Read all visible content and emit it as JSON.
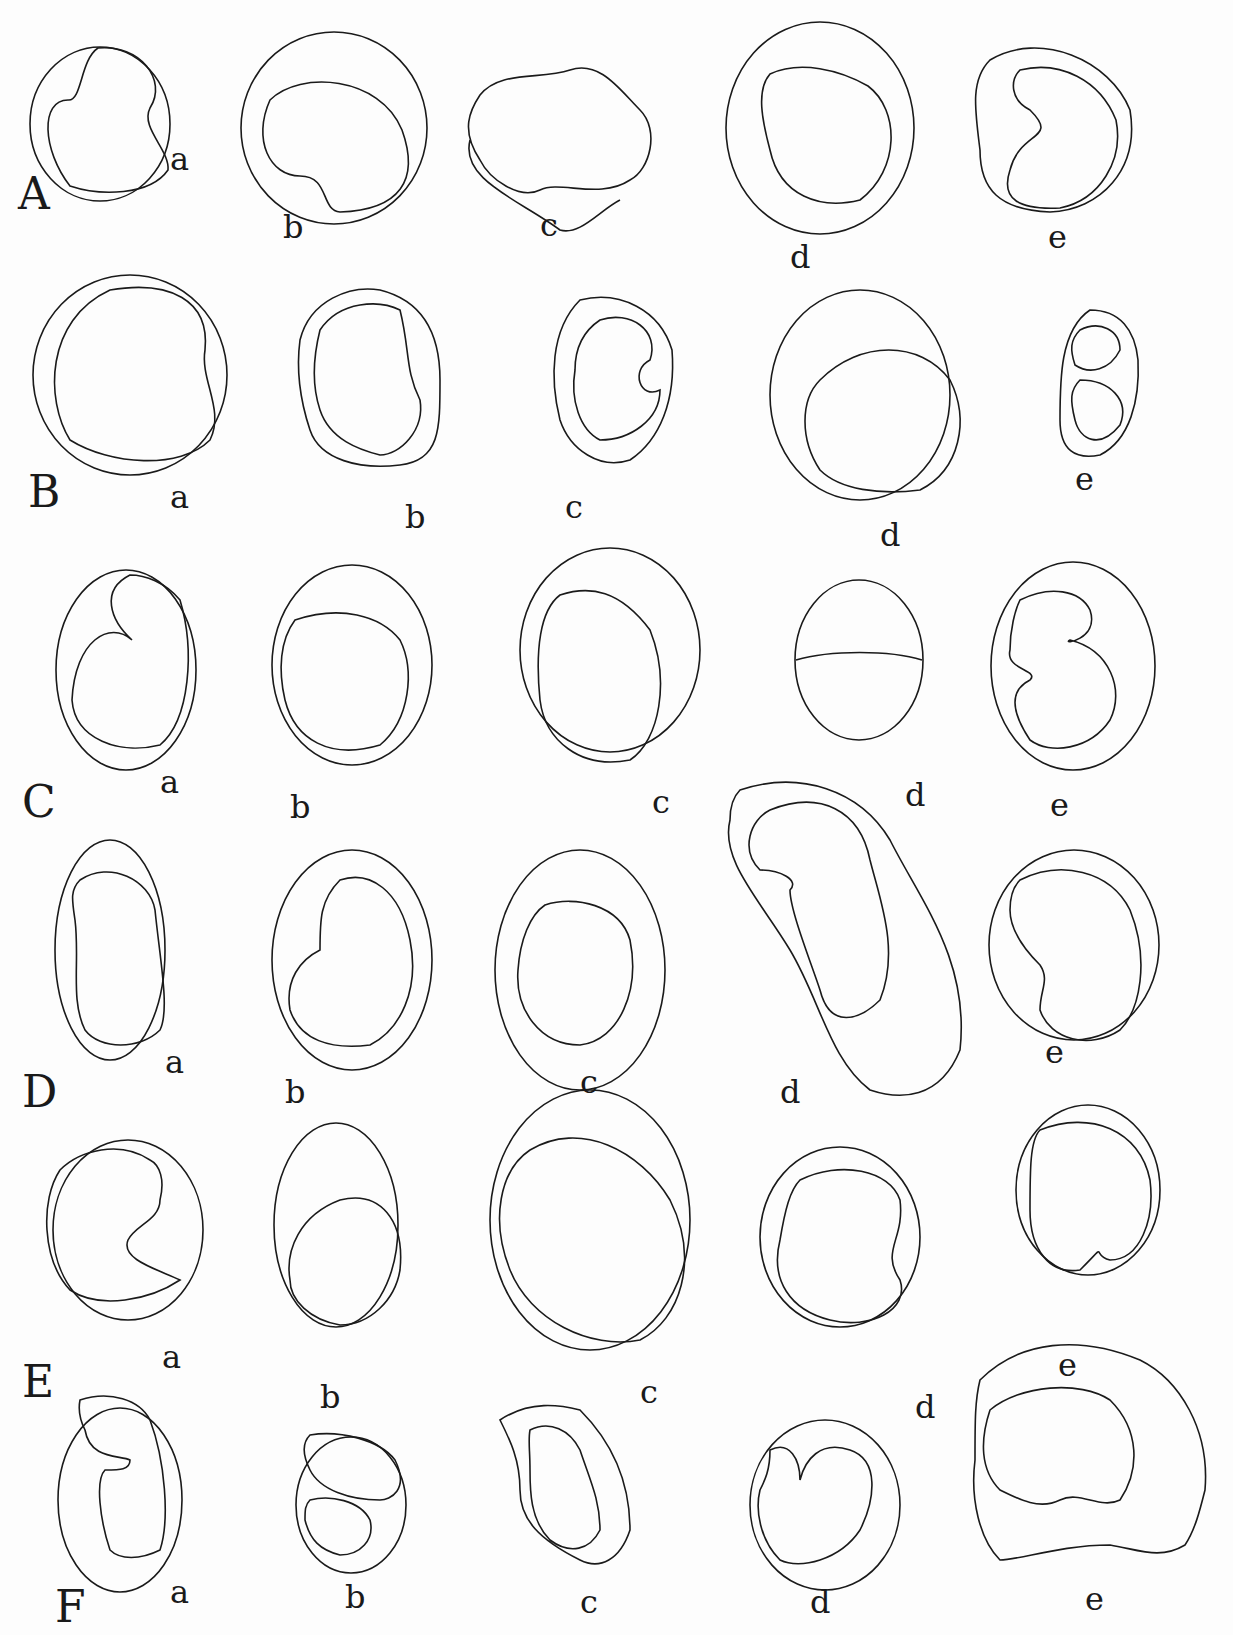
{
  "plate": {
    "rows": [
      {
        "label": "A",
        "label_pos": [
          18,
          212
        ],
        "cells": [
          {
            "label": "a",
            "label_pos": [
              170,
              172
            ],
            "outer": [
              100,
              124,
              70,
              77
            ],
            "inner": "M98,48 C140,44 168,80 150,108 C140,128 170,150 168,170 C150,196 100,196 70,186 C42,150 40,100 68,100 C82,102 80,60 98,48Z"
          },
          {
            "label": "b",
            "label_pos": [
              283,
              240
            ],
            "outer": [
              334,
              128,
              93,
              96
            ],
            "inner": "M270,100 C300,70 380,76 402,130 C420,180 400,210 340,212 C320,210 330,176 300,176 C270,176 252,140 270,100Z"
          },
          {
            "label": "c",
            "label_pos": [
              540,
              238
            ],
            "outer": null,
            "inner": "M480,95 C500,70 540,80 570,70 C600,60 620,90 640,110 C660,130 650,170 630,180 C600,200 560,180 540,190 C520,200 490,180 480,160 C460,130 470,110 480,95Z M470,140 C460,180 520,200 560,230 C580,236 600,210 620,200"
          },
          {
            "label": "d",
            "label_pos": [
              790,
              270
            ],
            "outer": [
              820,
              128,
              94,
              106
            ],
            "inner": "M770,74 C800,60 840,70 868,86 C900,110 900,170 860,200 C820,210 780,196 770,150 C762,120 756,90 770,74Z"
          },
          {
            "label": "e",
            "label_pos": [
              1048,
              250
            ],
            "outer": null,
            "inner": "M1020,70 C1060,60 1100,80 1116,120 C1124,160 1100,200 1060,208 C1020,210 1000,200 1010,170 C1020,130 1060,140 1030,110 C1010,100 1010,80 1020,70Z M990,60 C1040,30 1110,60 1130,110 C1140,170 1100,210 1050,212 C1000,210 980,190 980,150 C975,110 970,80 990,60Z"
          }
        ]
      },
      {
        "label": "B",
        "label_pos": [
          28,
          510
        ],
        "cells": [
          {
            "label": "a",
            "label_pos": [
              170,
              510
            ],
            "outer": [
              130,
              375,
              97,
              100
            ],
            "inner": "M110,290 C170,280 210,300 205,350 C200,380 225,410 210,440 C180,470 110,465 70,440 C45,400 45,320 110,290Z"
          },
          {
            "label": "b",
            "label_pos": [
              405,
              530
            ],
            "outer": null,
            "inner": "M300,340 C310,300 350,285 380,290 C420,300 440,330 440,380 C440,430 440,460 400,465 C360,470 320,460 310,430 C300,400 296,370 300,340Z M320,330 C340,300 380,300 400,310 C410,350 405,370 420,400 C425,430 400,455 380,455 C360,450 330,440 320,410 C310,380 315,350 320,330Z"
          },
          {
            "label": "c",
            "label_pos": [
              565,
              520
            ],
            "outer": null,
            "inner": "M580,300 C620,290 660,310 672,350 C676,400 660,440 630,460 C600,470 570,450 560,420 C550,380 550,330 580,300Z M600,320 C630,310 660,330 650,360 C630,370 640,400 660,390 C660,420 630,440 600,440 C580,430 570,400 575,370 C575,345 585,330 600,320Z"
          },
          {
            "label": "d",
            "label_pos": [
              880,
              548
            ],
            "outer": [
              860,
              395,
              90,
              105
            ],
            "inner": "M820,380 C860,340 920,340 950,380 C970,420 960,470 920,490 C880,495 840,490 820,470 C800,440 800,400 820,380Z"
          },
          {
            "label": "e",
            "label_pos": [
              1075,
              492
            ],
            "outer": null,
            "inner": "M1090,310 C1120,310 1135,330 1138,360 C1140,400 1130,440 1100,455 C1075,460 1060,450 1060,420 C1060,380 1060,330 1090,310Z M1080,330 C1100,320 1120,330 1120,350 C1110,370 1090,375 1075,365 C1070,350 1070,340 1080,330Z M1080,380 C1110,380 1130,400 1120,425 C1100,450 1080,440 1075,420 C1070,400 1070,390 1080,380Z"
          }
        ]
      },
      {
        "label": "C",
        "label_pos": [
          22,
          820
        ],
        "cells": [
          {
            "label": "a",
            "label_pos": [
              160,
              795
            ],
            "outer": [
              126,
              670,
              70,
              100
            ],
            "inner": "M130,575 C100,590 110,620 132,640 C110,620 75,640 72,700 C75,740 120,755 160,745 C190,720 195,650 180,600 C165,582 145,575 130,575Z"
          },
          {
            "label": "b",
            "label_pos": [
              290,
              820
            ],
            "outer": [
              352,
              665,
              80,
              100
            ],
            "inner": "M295,620 C340,605 380,615 400,640 C415,670 410,720 380,745 C330,760 295,740 285,700 C278,670 280,640 295,620Z"
          },
          {
            "label": "c",
            "label_pos": [
              652,
              815
            ],
            "outer": [
              610,
              650,
              90,
              102
            ],
            "inner": "M560,595 C590,585 620,590 650,630 C670,680 660,740 630,760 C580,770 545,740 540,700 C535,650 540,610 560,595Z"
          },
          {
            "label": "d",
            "label_pos": [
              905,
              808
            ],
            "outer": [
              859,
              660,
              64,
              80
            ],
            "inner": "M796,660 C830,650 890,650 922,660"
          },
          {
            "label": "e",
            "label_pos": [
              1050,
              818
            ],
            "outer": [
              1073,
              666,
              82,
              104
            ],
            "inner": "M1020,600 C1050,585 1080,590 1090,610 C1100,640 1060,645 1070,640 C1110,650 1125,690 1110,720 C1090,750 1050,755 1030,740 C1010,710 1010,690 1030,680 C1040,670 1005,670 1010,650 C1010,630 1015,610 1020,600Z"
          }
        ]
      },
      {
        "label": "D",
        "label_pos": [
          22,
          1110
        ],
        "cells": [
          {
            "label": "a",
            "label_pos": [
              165,
              1075
            ],
            "outer": [
              110,
              950,
              55,
              110
            ],
            "inner": "M80,880 C110,860 150,880 155,910 C160,960 170,1010 160,1030 C140,1050 100,1050 85,1030 C70,1000 80,960 75,920 C72,900 70,890 80,880Z"
          },
          {
            "label": "b",
            "label_pos": [
              285,
              1105
            ],
            "outer": [
              352,
              960,
              80,
              110
            ],
            "inner": "M340,880 C370,870 400,890 410,940 C420,990 400,1030 370,1045 C330,1050 300,1040 290,1010 C285,980 300,960 320,950 C320,920 320,900 340,880Z"
          },
          {
            "label": "c",
            "label_pos": [
              580,
              1095
            ],
            "outer": [
              580,
              970,
              85,
              120
            ],
            "inner": "M545,905 C575,895 620,905 630,940 C640,990 620,1040 580,1045 C540,1045 515,1010 518,970 C520,940 530,915 545,905Z"
          },
          {
            "label": "d",
            "label_pos": [
              780,
              1105
            ],
            "outer": null,
            "inner": "M770,810 C820,790 860,810 870,860 C880,900 900,950 880,1000 C860,1020 830,1030 820,990 C810,960 790,910 790,890 C800,880 780,870 760,870 C740,850 750,820 770,810Z M740,790 C800,770 860,790 890,840 C920,900 970,960 960,1050 C940,1100 900,1100 870,1090 C830,1060 820,1000 790,950 C760,900 720,860 730,820 C730,805 735,795 740,790Z"
          },
          {
            "label": "e",
            "label_pos": [
              1045,
              1065
            ],
            "outer": [
              1074,
              945,
              85,
              95
            ],
            "inner": "M1020,880 C1060,860 1110,870 1130,910 C1150,960 1140,1010 1120,1030 C1090,1050 1050,1040 1040,1010 C1040,990 1050,980 1040,965 C1025,950 1010,930 1010,910 C1010,895 1015,885 1020,880Z"
          }
        ]
      },
      {
        "label": "E",
        "label_pos": [
          22,
          1400
        ],
        "cells": [
          {
            "label": "a",
            "label_pos": [
              162,
              1370
            ],
            "outer": [
              128,
              1230,
              75,
              90
            ],
            "inner": "M150,1160 C120,1140 80,1150 60,1170 C40,1200 42,1260 70,1290 C100,1310 150,1300 180,1280 C160,1270 120,1260 128,1240 C135,1225 160,1220 160,1200 C165,1180 160,1165 150,1160Z"
          },
          {
            "label": "b",
            "label_pos": [
              320,
              1410
            ],
            "outer": [
              336,
              1225,
              62,
              102
            ],
            "inner": "M340,1200 C380,1190 405,1220 400,1270 C395,1300 370,1325 340,1325 C310,1320 290,1300 290,1280 C285,1250 300,1215 340,1200Z"
          },
          {
            "label": "c",
            "label_pos": [
              640,
              1405
            ],
            "outer": [
              590,
              1220,
              100,
              130
            ],
            "inner": "M530,1150 C580,1120 640,1150 670,1200 C700,1260 680,1320 640,1340 C590,1350 530,1320 510,1270 C490,1220 500,1170 530,1150Z"
          },
          {
            "label": "d",
            "label_pos": [
              915,
              1420
            ],
            "outer": [
              840,
              1237,
              80,
              90
            ],
            "inner": "M800,1180 C840,1160 890,1170 900,1200 C905,1240 880,1250 900,1280 C910,1310 870,1330 830,1320 C790,1310 770,1280 780,1240 C785,1210 790,1190 800,1180Z"
          },
          {
            "label": "e",
            "label_pos": [
              1058,
              1378
            ],
            "outer": [
              1088,
              1190,
              72,
              85
            ],
            "inner": "M1040,1130 C1090,1110 1140,1130 1150,1180 C1155,1220 1140,1260 1110,1260 C1090,1255 1110,1240 1080,1270 C1050,1275 1030,1250 1030,1210 C1030,1170 1030,1140 1040,1130Z"
          }
        ]
      },
      {
        "label": "F",
        "label_pos": [
          55,
          1625
        ],
        "cells": [
          {
            "label": "a",
            "label_pos": [
              170,
              1605
            ],
            "outer": [
              120,
              1500,
              62,
              92
            ],
            "inner": "M80,1400 C110,1390 140,1400 150,1420 C165,1460 170,1520 160,1550 C140,1560 120,1560 110,1550 C100,1520 95,1480 105,1470 C120,1470 130,1470 130,1460 C120,1455 90,1460 85,1430 C80,1420 78,1410 80,1400Z"
          },
          {
            "label": "b",
            "label_pos": [
              345,
              1610
            ],
            "outer": [
              351,
              1505,
              55,
              68
            ],
            "inner": "M310,1435 C340,1430 380,1440 395,1460 C410,1490 390,1500 380,1500 C350,1500 320,1490 310,1470 C300,1450 305,1440 310,1435Z M310,1500 C330,1495 360,1500 370,1520 C375,1540 360,1555 340,1555 C320,1550 310,1540 305,1520 C305,1510 305,1505 310,1500Z"
          },
          {
            "label": "c",
            "label_pos": [
              580,
              1615
            ],
            "outer": null,
            "inner": "M500,1420 C530,1400 560,1405 580,1410 C610,1440 630,1480 630,1530 C620,1560 600,1570 580,1560 C540,1540 520,1520 520,1490 C520,1460 510,1440 500,1420Z M530,1430 C550,1420 570,1430 580,1450 C590,1480 600,1500 600,1530 C590,1550 570,1555 550,1540 C530,1520 530,1490 530,1470 C530,1450 528,1440 530,1430Z"
          },
          {
            "label": "d",
            "label_pos": [
              810,
              1615
            ],
            "outer": [
              825,
              1505,
              75,
              85
            ],
            "inner": "M770,1450 C790,1440 800,1460 800,1480 C805,1460 820,1440 850,1450 C880,1460 875,1500 860,1530 C840,1560 800,1570 780,1560 C760,1540 755,1510 760,1490 C765,1480 770,1470 770,1450Z"
          },
          {
            "label": "e",
            "label_pos": [
              1085,
              1612
            ],
            "outer": null,
            "inner": "M990,1410 C1020,1385 1080,1380 1110,1400 C1140,1430 1140,1470 1120,1500 C1100,1510 1080,1490 1060,1500 C1040,1510 1020,1500 1000,1490 C980,1470 980,1440 990,1410Z M980,1380 C1020,1340 1080,1335 1140,1360 C1180,1380 1210,1430 1205,1490 C1200,1510 1195,1530 1185,1545 C1160,1560 1140,1550 1110,1545 C1060,1545 1020,1560 1000,1560 C980,1540 970,1500 975,1460 C975,1420 975,1400 980,1380Z"
          }
        ]
      }
    ]
  }
}
